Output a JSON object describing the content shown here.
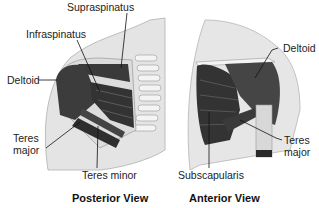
{
  "posterior": {
    "title": "Posterior View",
    "labels": {
      "supraspinatus": "Supraspinatus",
      "infraspinatus": "Infraspinatus",
      "deltoid": "Deltoid",
      "teres_major_1": "Teres",
      "teres_major_2": "major",
      "teres_minor": "Teres minor"
    }
  },
  "anterior": {
    "title": "Anterior View",
    "labels": {
      "deltoid": "Deltoid",
      "teres_major_1": "Teres",
      "teres_major_2": "major",
      "subscapularis": "Subscapularis"
    }
  },
  "colors": {
    "muscle_dark": "#3a3a3a",
    "muscle_mid": "#555555",
    "skin": "#e6e6e6",
    "bone": "#f2f2f2",
    "outline": "#9a9a9a"
  }
}
